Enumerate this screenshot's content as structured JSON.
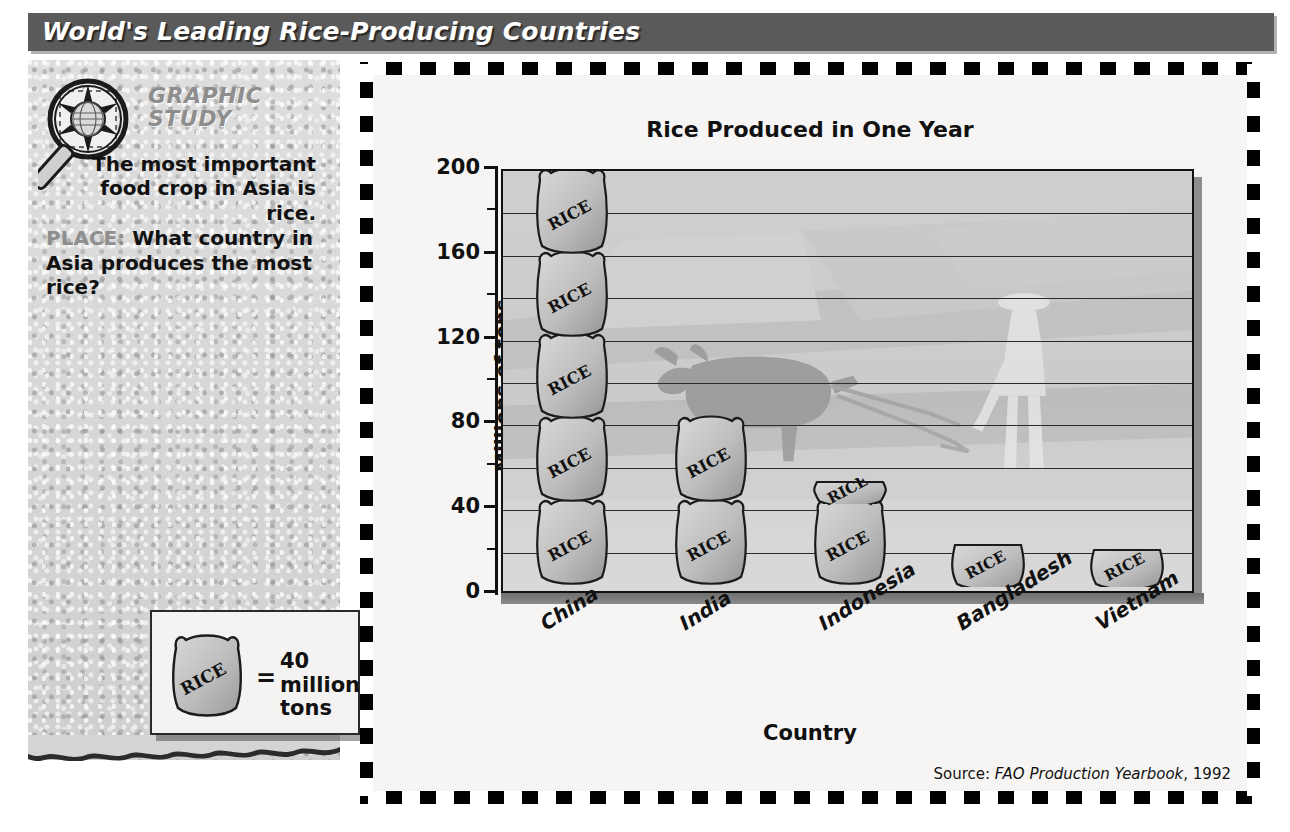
{
  "header": {
    "title": "World's Leading Rice-Producing Countries"
  },
  "sidebar": {
    "logo_name": "graphic-study-magnifier-globe-icon",
    "heading_line1": "GRAPHIC",
    "heading_line2": "STUDY",
    "intro_line1": "The most important",
    "intro_line2": "food crop in Asia is rice.",
    "place_label": "PLACE:",
    "question": "What country in Asia produces the most rice?"
  },
  "legend": {
    "bag_label": "RICE",
    "equals": "=",
    "value_text": "40 million tons"
  },
  "chart_data": {
    "type": "bar",
    "title": "Rice Produced in One Year",
    "xlabel": "Country",
    "ylabel": "Millions of tons",
    "ylim": [
      0,
      200
    ],
    "yticks": [
      0,
      40,
      80,
      120,
      160,
      200
    ],
    "minor_tick_interval": 20,
    "grid": true,
    "unit_note": "Each pictograph bag = 40 million tons",
    "categories": [
      "China",
      "India",
      "Indonesia",
      "Bangladesh",
      "Vietnam"
    ],
    "values": [
      186,
      75,
      45,
      20,
      18
    ],
    "bags": [
      5,
      2,
      1.15,
      0.5,
      0.45
    ],
    "bag_label": "RICE",
    "source": "Source:",
    "source_title": "FAO Production Yearbook",
    "source_year": ", 1992",
    "background_image": "faded photo of a farmer plowing a rice paddy with an ox"
  },
  "colors": {
    "header_bar": "#5a5a5a",
    "heading_gray": "#8e8e8e",
    "plot_fill": "#cfcfcf",
    "bag_fill": "#b7b7b7",
    "frame": "#000000"
  }
}
